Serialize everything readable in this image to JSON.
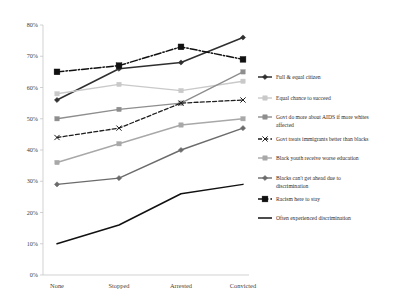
{
  "chart_data": {
    "type": "line",
    "title": "",
    "xlabel": "",
    "ylabel": "",
    "categories": [
      "None",
      "Stopped",
      "Arrested",
      "Convicted"
    ],
    "ylim": [
      0,
      80
    ],
    "ytick_labels": [
      "0%",
      "10%",
      "20%",
      "30%",
      "40%",
      "50%",
      "60%",
      "70%",
      "80%"
    ],
    "ytick_values": [
      0,
      10,
      20,
      30,
      40,
      50,
      60,
      70,
      80
    ],
    "grid": false,
    "legend_position": "right",
    "series": [
      {
        "name": "Full & equal citizen",
        "values": [
          56,
          66,
          68,
          76
        ],
        "color": "#2f2f2f",
        "dash": "none",
        "marker": "diamond",
        "width": 1.5
      },
      {
        "name": "Equal chance to succeed",
        "values": [
          58,
          61,
          59,
          62
        ],
        "color": "#c9c9c9",
        "dash": "none",
        "marker": "square",
        "width": 1.4
      },
      {
        "name": "Govt do more about AIDS if more whites affected",
        "values": [
          50,
          53,
          55,
          65
        ],
        "color": "#8e8e8e",
        "dash": "none",
        "marker": "square",
        "width": 1.4
      },
      {
        "name": "Govt treats immigrants better than blacks",
        "values": [
          44,
          47,
          55,
          56
        ],
        "color": "#1f1f1f",
        "dash": "4,2.2",
        "marker": "x",
        "width": 1.3
      },
      {
        "name": "Black youth receive worse education",
        "values": [
          36,
          42,
          48,
          50
        ],
        "color": "#a8a8a8",
        "dash": "none",
        "marker": "square",
        "width": 1.4
      },
      {
        "name": "Blacks can't get ahead due to discrimination",
        "values": [
          29,
          31,
          40,
          47
        ],
        "color": "#6b6b6b",
        "dash": "none",
        "marker": "diamond",
        "width": 1.4
      },
      {
        "name": "Racism here to stay",
        "values": [
          65,
          67,
          73,
          69
        ],
        "color": "#101010",
        "dash": "7,2,1.4,2",
        "marker": "square-large",
        "width": 1.5
      },
      {
        "name": "Often experienced discrimination",
        "values": [
          10,
          16,
          26,
          29
        ],
        "color": "#111111",
        "dash": "none",
        "marker": "none",
        "width": 1.5
      }
    ]
  }
}
